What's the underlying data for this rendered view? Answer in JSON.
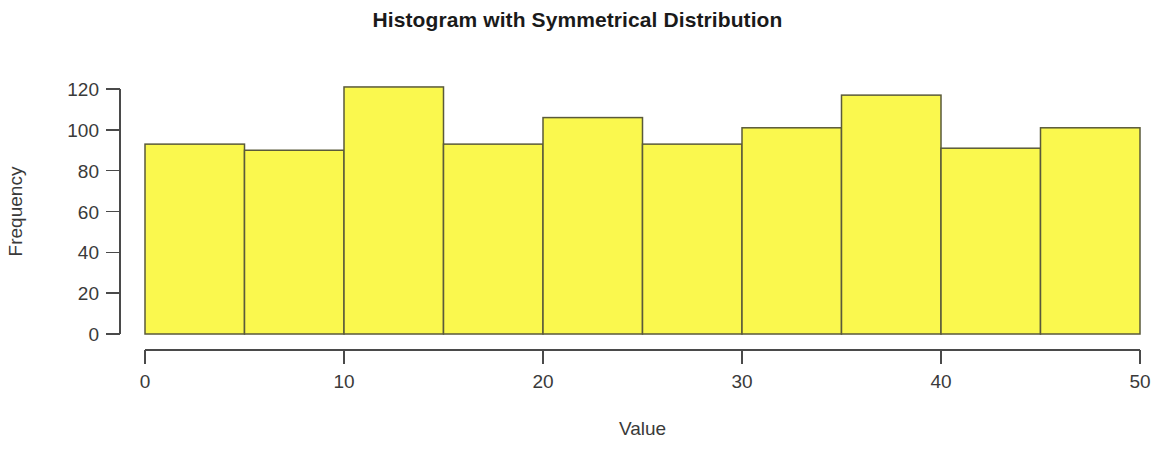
{
  "chart_data": {
    "type": "bar",
    "title": "Histogram with Symmetrical Distribution",
    "xlabel": "Value",
    "ylabel": "Frequency",
    "bin_edges": [
      0,
      5,
      10,
      15,
      20,
      25,
      30,
      35,
      40,
      45,
      50
    ],
    "categories": [
      "0-5",
      "5-10",
      "10-15",
      "15-20",
      "20-25",
      "25-30",
      "30-35",
      "35-40",
      "40-45",
      "45-50"
    ],
    "values": [
      93,
      90,
      121,
      93,
      106,
      93,
      101,
      117,
      91,
      101
    ],
    "xlim": [
      0,
      50
    ],
    "ylim": [
      0,
      120
    ],
    "xticks": [
      0,
      10,
      20,
      30,
      40,
      50
    ],
    "xtick_labels": [
      "0",
      "10",
      "20",
      "30",
      "40",
      "50"
    ],
    "yticks": [
      0,
      20,
      40,
      60,
      80,
      100,
      120
    ],
    "ytick_labels": [
      "0",
      "20",
      "40",
      "60",
      "80",
      "100",
      "120"
    ],
    "grid": false,
    "legend": null,
    "bar_fill_color": "#FAF84E",
    "bar_border_color": "#5A5A3A",
    "axis_color": "#4A4A4A",
    "title_color": "#1A1A1A"
  }
}
